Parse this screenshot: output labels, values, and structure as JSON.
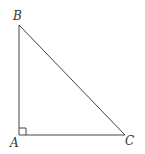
{
  "diagram": {
    "type": "right-triangle",
    "vertices": [
      {
        "label": "A",
        "x": 19,
        "y": 135,
        "label_x": 10,
        "label_y": 147
      },
      {
        "label": "B",
        "x": 19,
        "y": 25,
        "label_x": 13,
        "label_y": 20
      },
      {
        "label": "C",
        "x": 125,
        "y": 135,
        "label_x": 125,
        "label_y": 145
      }
    ],
    "right_angle_at": "A",
    "right_angle_marker_size": 7,
    "colors": {
      "stroke": "#444444",
      "label": "#333333",
      "background": "#ffffff"
    }
  }
}
